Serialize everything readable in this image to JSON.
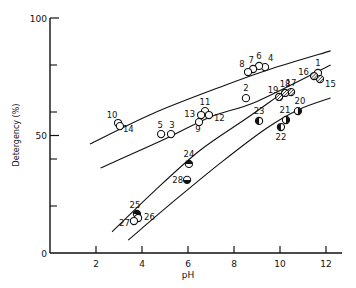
{
  "chart_data": {
    "type": "scatter",
    "title": "",
    "xlabel": "pH",
    "ylabel": "Detergency (%)",
    "xlim": [
      0,
      12.7
    ],
    "ylim": [
      0,
      100
    ],
    "x_ticks": [
      2,
      4,
      6,
      8,
      10,
      12
    ],
    "y_ticks": [
      0,
      50,
      100
    ],
    "y_minor_ticks": [
      20,
      40,
      60,
      80
    ],
    "grid": false,
    "legend": null,
    "points": [
      {
        "id": "1",
        "x": 11.65,
        "y": 76.6,
        "marker": "open"
      },
      {
        "id": "2",
        "x": 8.52,
        "y": 65.9,
        "marker": "open"
      },
      {
        "id": "3",
        "x": 5.26,
        "y": 50.6,
        "marker": "open"
      },
      {
        "id": "4",
        "x": 9.35,
        "y": 79.1,
        "marker": "open"
      },
      {
        "id": "5",
        "x": 4.83,
        "y": 50.6,
        "marker": "open"
      },
      {
        "id": "6",
        "x": 9.09,
        "y": 79.6,
        "marker": "open"
      },
      {
        "id": "7",
        "x": 8.83,
        "y": 78.3,
        "marker": "open"
      },
      {
        "id": "8",
        "x": 8.61,
        "y": 77.0,
        "marker": "open"
      },
      {
        "id": "9",
        "x": 6.48,
        "y": 55.7,
        "marker": "open"
      },
      {
        "id": "10",
        "x": 2.96,
        "y": 55.3,
        "marker": "open"
      },
      {
        "id": "11",
        "x": 6.74,
        "y": 60.4,
        "marker": "open"
      },
      {
        "id": "12",
        "x": 6.91,
        "y": 58.7,
        "marker": "open"
      },
      {
        "id": "13",
        "x": 6.57,
        "y": 58.7,
        "marker": "open"
      },
      {
        "id": "14",
        "x": 3.04,
        "y": 54.0,
        "marker": "open"
      },
      {
        "id": "15",
        "x": 11.74,
        "y": 74.0,
        "marker": "hatched"
      },
      {
        "id": "16",
        "x": 11.48,
        "y": 75.3,
        "marker": "hatched"
      },
      {
        "id": "17",
        "x": 10.48,
        "y": 68.5,
        "marker": "hatched"
      },
      {
        "id": "18",
        "x": 10.22,
        "y": 68.1,
        "marker": "hatched"
      },
      {
        "id": "19",
        "x": 9.96,
        "y": 66.4,
        "marker": "hatched"
      },
      {
        "id": "20",
        "x": 10.78,
        "y": 60.4,
        "marker": "half-right"
      },
      {
        "id": "21",
        "x": 10.26,
        "y": 56.6,
        "marker": "half-right"
      },
      {
        "id": "22",
        "x": 10.04,
        "y": 53.6,
        "marker": "half-left"
      },
      {
        "id": "23",
        "x": 9.09,
        "y": 56.2,
        "marker": "half-left"
      },
      {
        "id": "24",
        "x": 6.04,
        "y": 37.9,
        "marker": "half-top"
      },
      {
        "id": "25",
        "x": 3.78,
        "y": 16.6,
        "marker": "half-top"
      },
      {
        "id": "26",
        "x": 3.83,
        "y": 14.9,
        "marker": "open"
      },
      {
        "id": "27",
        "x": 3.65,
        "y": 13.6,
        "marker": "open"
      },
      {
        "id": "28",
        "x": 5.96,
        "y": 31.1,
        "marker": "half-bottom"
      }
    ],
    "curves": [
      {
        "name": "curve-1",
        "points": [
          [
            1.74,
            46.4
          ],
          [
            4.5,
            59.5
          ],
          [
            7.5,
            71.0
          ],
          [
            9.5,
            78.0
          ],
          [
            12.2,
            86.0
          ]
        ]
      },
      {
        "name": "curve-2",
        "points": [
          [
            2.2,
            36.2
          ],
          [
            5.0,
            48.5
          ],
          [
            7.0,
            58.0
          ],
          [
            9.0,
            64.5
          ],
          [
            12.2,
            80.0
          ]
        ]
      },
      {
        "name": "curve-3",
        "points": [
          [
            2.7,
            9.0
          ],
          [
            4.5,
            26.0
          ],
          [
            6.5,
            43.5
          ],
          [
            8.5,
            57.0
          ],
          [
            9.8,
            66.0
          ]
        ]
      },
      {
        "name": "curve-4",
        "points": [
          [
            3.4,
            5.5
          ],
          [
            5.5,
            23.0
          ],
          [
            7.5,
            39.0
          ],
          [
            9.4,
            53.0
          ],
          [
            10.8,
            61.0
          ],
          [
            12.2,
            66.0
          ]
        ]
      }
    ]
  }
}
